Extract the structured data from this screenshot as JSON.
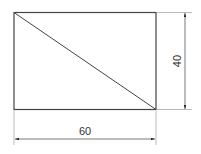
{
  "diagram": {
    "type": "technical-drawing",
    "shape": "rectangle-with-diagonal",
    "rectangle": {
      "width_units": 60,
      "height_units": 40
    },
    "diagonal": "top-left to bottom-right",
    "dimensions": {
      "horizontal": {
        "label": "60",
        "position": "bottom"
      },
      "vertical": {
        "label": "40",
        "position": "right"
      }
    },
    "colors": {
      "outline": "#333333",
      "dimension_line": "#555555",
      "extension_line": "#aaaaaa",
      "background": "#ffffff"
    }
  }
}
